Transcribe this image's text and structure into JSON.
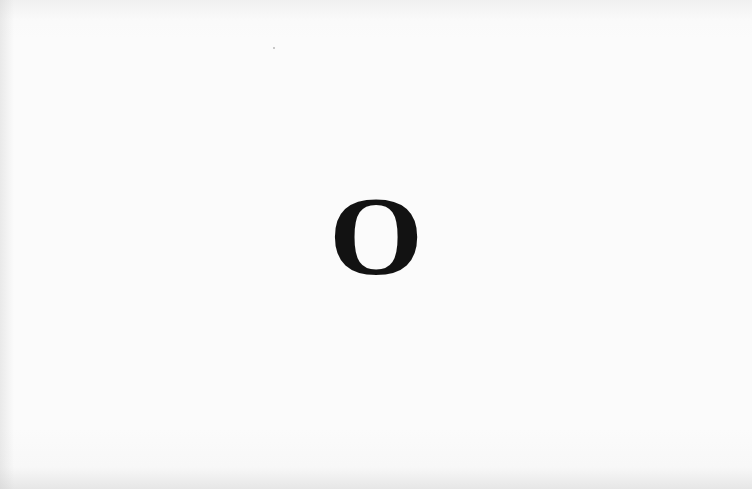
{
  "page": {
    "background_color": "#fafafa",
    "text_color": "#121212"
  },
  "main": {
    "letter": "O"
  }
}
